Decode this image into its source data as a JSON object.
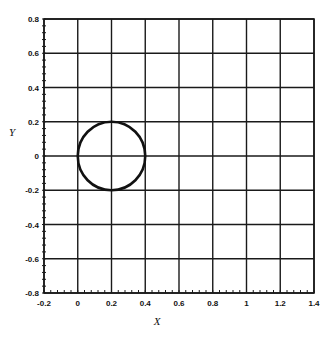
{
  "chart_data": {
    "type": "line",
    "title": "",
    "xlabel": "X",
    "ylabel": "Y",
    "xlim": [
      -0.2,
      1.4
    ],
    "ylim": [
      -0.8,
      0.8
    ],
    "grid": true,
    "legend": null,
    "x_ticks": [
      -0.2,
      0,
      0.2,
      0.4,
      0.6,
      0.8,
      1,
      1.2,
      1.4
    ],
    "x_tick_labels": [
      "-0.2",
      "0",
      "0.2",
      "0.4",
      "0.6",
      "0.8",
      "1",
      "1.2",
      "1.4"
    ],
    "y_ticks": [
      0.8,
      0.6,
      0.4,
      0.2,
      0,
      -0.2,
      -0.4,
      -0.6,
      -0.8
    ],
    "y_tick_labels": [
      "0.8",
      "0.6",
      "0.4",
      "0.2",
      "0",
      "-0.2",
      "-0.4",
      "-0.6",
      "-0.8"
    ],
    "series": [
      {
        "name": "circle",
        "shape": "circle",
        "center": [
          0.2,
          0
        ],
        "radius": 0.2,
        "color": "#111111"
      }
    ]
  },
  "colors": {
    "grid": "#1a1a1a",
    "curve": "#111111",
    "background": "#ffffff"
  }
}
